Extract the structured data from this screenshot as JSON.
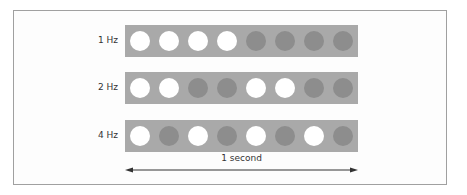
{
  "figure": {
    "colors": {
      "bar": "#a9a9a9",
      "dot_on": "#ffffff",
      "dot_off": "#8d8d8d",
      "frame": "#a0a0a0",
      "arrow": "#333333"
    },
    "rows": [
      {
        "label": "1 Hz",
        "pattern": [
          1,
          1,
          1,
          1,
          0,
          0,
          0,
          0
        ]
      },
      {
        "label": "2 Hz",
        "pattern": [
          1,
          1,
          0,
          0,
          1,
          1,
          0,
          0
        ]
      },
      {
        "label": "4 Hz",
        "pattern": [
          1,
          0,
          1,
          0,
          1,
          0,
          1,
          0
        ]
      }
    ],
    "time_axis": {
      "label": "1 second"
    }
  }
}
